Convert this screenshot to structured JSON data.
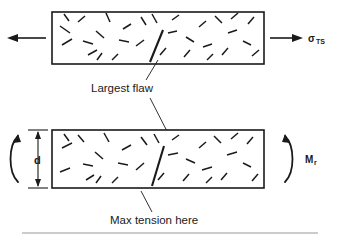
{
  "figure": {
    "name": "flaw-distribution-tension-vs-bending-diagram",
    "background_color": "#ffffff",
    "ink_color": "#1a1a1a",
    "rule_color": "#9a9a9a"
  },
  "labels": {
    "largest_flaw": "Largest flaw",
    "max_tension": "Max tension here",
    "tensile_stress_symbol": "σ",
    "tensile_stress_subscript": "TS",
    "moment_symbol": "M",
    "moment_subscript": "r",
    "depth_symbol": "d"
  },
  "panels": [
    {
      "id": "tension-panel",
      "name": "uniform-tension-bar",
      "loading": "uniform-tension",
      "rect": {
        "x": 52,
        "y": 12,
        "width": 212,
        "height": 52
      },
      "left_arrow": {
        "x1": 46,
        "y1": 38,
        "x2": 8,
        "y2": 38,
        "direction": "left"
      },
      "right_arrow": {
        "x1": 270,
        "y1": 38,
        "x2": 302,
        "y2": 38,
        "direction": "right"
      }
    },
    {
      "id": "bending-panel",
      "name": "bending-moment-bar",
      "loading": "bending-moment",
      "rect": {
        "x": 52,
        "y": 130,
        "width": 212,
        "height": 58
      },
      "depth_dimension": {
        "x": 38,
        "y_top": 130,
        "y_bottom": 188
      }
    }
  ],
  "flaws": {
    "description": "short randomly oriented microcrack segments",
    "tension_panel": [
      [
        62,
        45,
        72,
        39
      ],
      [
        60,
        26,
        70,
        33
      ],
      [
        78,
        22,
        85,
        16
      ],
      [
        88,
        55,
        97,
        50
      ],
      [
        96,
        31,
        104,
        38
      ],
      [
        83,
        41,
        93,
        44
      ],
      [
        106,
        13,
        110,
        22
      ],
      [
        112,
        60,
        118,
        54
      ],
      [
        123,
        29,
        131,
        24
      ],
      [
        119,
        40,
        129,
        42
      ],
      [
        136,
        46,
        144,
        40
      ],
      [
        141,
        17,
        146,
        25
      ],
      [
        152,
        14,
        157,
        23
      ],
      [
        160,
        55,
        166,
        48
      ],
      [
        168,
        33,
        177,
        31
      ],
      [
        172,
        20,
        179,
        15
      ],
      [
        184,
        57,
        190,
        50
      ],
      [
        186,
        37,
        194,
        42
      ],
      [
        199,
        27,
        206,
        21
      ],
      [
        203,
        47,
        212,
        44
      ],
      [
        215,
        16,
        222,
        23
      ],
      [
        222,
        55,
        228,
        48
      ],
      [
        228,
        33,
        237,
        30
      ],
      [
        231,
        19,
        238,
        13
      ],
      [
        243,
        41,
        251,
        45
      ],
      [
        248,
        24,
        254,
        17
      ],
      [
        252,
        56,
        259,
        50
      ],
      [
        64,
        14,
        69,
        21
      ],
      [
        97,
        60,
        102,
        53
      ],
      [
        207,
        60,
        213,
        54
      ]
    ],
    "tension_panel_largest": [
      150,
      62,
      163,
      30
    ],
    "bending_panel": [
      [
        62,
        148,
        72,
        143
      ],
      [
        60,
        172,
        70,
        168
      ],
      [
        78,
        135,
        84,
        142
      ],
      [
        86,
        180,
        94,
        175
      ],
      [
        95,
        152,
        103,
        159
      ],
      [
        83,
        164,
        93,
        166
      ],
      [
        104,
        133,
        109,
        142
      ],
      [
        112,
        183,
        118,
        177
      ],
      [
        122,
        150,
        131,
        145
      ],
      [
        118,
        163,
        128,
        165
      ],
      [
        136,
        170,
        144,
        163
      ],
      [
        141,
        137,
        147,
        145
      ],
      [
        154,
        134,
        159,
        143
      ],
      [
        158,
        180,
        164,
        173
      ],
      [
        168,
        155,
        178,
        153
      ],
      [
        172,
        140,
        179,
        135
      ],
      [
        183,
        181,
        189,
        174
      ],
      [
        186,
        159,
        195,
        163
      ],
      [
        199,
        148,
        206,
        142
      ],
      [
        202,
        170,
        212,
        167
      ],
      [
        214,
        136,
        221,
        143
      ],
      [
        221,
        180,
        227,
        173
      ],
      [
        227,
        155,
        237,
        152
      ],
      [
        231,
        139,
        238,
        133
      ],
      [
        243,
        163,
        251,
        167
      ],
      [
        247,
        144,
        253,
        137
      ],
      [
        252,
        181,
        258,
        174
      ],
      [
        64,
        134,
        69,
        141
      ],
      [
        96,
        183,
        101,
        176
      ],
      [
        206,
        183,
        212,
        177
      ]
    ],
    "bending_panel_largest": [
      152,
      186,
      164,
      146
    ]
  },
  "annotations": [
    {
      "id": "largest-flaw-annotation",
      "name": "largest-flaw-leader",
      "text_anchor": {
        "x": 91,
        "y": 92
      },
      "leaders": [
        {
          "x1": 146,
          "y1": 80,
          "x2": 158,
          "y2": 60
        },
        {
          "x1": 150,
          "y1": 97,
          "x2": 171,
          "y2": 139
        }
      ]
    },
    {
      "id": "max-tension-annotation",
      "name": "max-tension-leader",
      "text_anchor": {
        "x": 110,
        "y": 224
      },
      "leaders": [
        {
          "x1": 152,
          "y1": 212,
          "x2": 141,
          "y2": 191
        }
      ]
    }
  ],
  "rule": {
    "x1": 22,
    "y1": 233,
    "x2": 318,
    "y2": 233
  }
}
